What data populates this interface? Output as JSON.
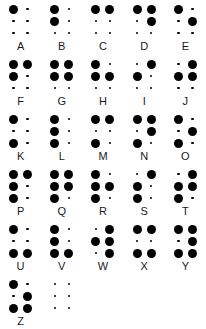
{
  "chart": {
    "background_color": "#ffffff",
    "dot_color": "#000000",
    "label_color": "#1a1a1a",
    "cells_per_row": 5,
    "dot_positions": [
      1,
      2,
      3,
      4,
      5,
      6
    ],
    "legend": {
      "raised_dot": "large filled dot",
      "flat_dot": "small filled dot"
    }
  },
  "rows": [
    {
      "index": 0,
      "cells": [
        {
          "label": "A",
          "dots": [
            1
          ]
        },
        {
          "label": "B",
          "dots": [
            1,
            2
          ]
        },
        {
          "label": "C",
          "dots": [
            1,
            4
          ]
        },
        {
          "label": "D",
          "dots": [
            1,
            4,
            5
          ]
        },
        {
          "label": "E",
          "dots": [
            1,
            5
          ]
        }
      ]
    },
    {
      "index": 1,
      "cells": [
        {
          "label": "F",
          "dots": [
            1,
            2,
            4
          ]
        },
        {
          "label": "G",
          "dots": [
            1,
            2,
            4,
            5
          ]
        },
        {
          "label": "H",
          "dots": [
            1,
            2,
            5
          ]
        },
        {
          "label": "I",
          "dots": [
            2,
            4
          ]
        },
        {
          "label": "J",
          "dots": [
            2,
            4,
            5
          ]
        }
      ]
    },
    {
      "index": 2,
      "cells": [
        {
          "label": "K",
          "dots": [
            1,
            3
          ]
        },
        {
          "label": "L",
          "dots": [
            1,
            2,
            3
          ]
        },
        {
          "label": "M",
          "dots": [
            1,
            3,
            4
          ]
        },
        {
          "label": "N",
          "dots": [
            1,
            3,
            4,
            5
          ]
        },
        {
          "label": "O",
          "dots": [
            1,
            3,
            5
          ]
        }
      ]
    },
    {
      "index": 3,
      "cells": [
        {
          "label": "P",
          "dots": [
            1,
            2,
            3,
            4
          ]
        },
        {
          "label": "Q",
          "dots": [
            1,
            2,
            3,
            4,
            5
          ]
        },
        {
          "label": "R",
          "dots": [
            1,
            2,
            3,
            5
          ]
        },
        {
          "label": "S",
          "dots": [
            2,
            3,
            4
          ]
        },
        {
          "label": "T",
          "dots": [
            2,
            3,
            4,
            5
          ]
        }
      ]
    },
    {
      "index": 4,
      "cells": [
        {
          "label": "U",
          "dots": [
            1,
            3,
            6
          ]
        },
        {
          "label": "V",
          "dots": [
            1,
            2,
            3,
            6
          ]
        },
        {
          "label": "W",
          "dots": [
            2,
            4,
            5,
            6
          ]
        },
        {
          "label": "X",
          "dots": [
            1,
            3,
            4,
            6
          ]
        },
        {
          "label": "Y",
          "dots": [
            1,
            3,
            4,
            5,
            6
          ]
        }
      ]
    },
    {
      "index": 5,
      "cells": [
        {
          "label": "Z",
          "dots": [
            1,
            3,
            5,
            6
          ]
        },
        {
          "label": "",
          "dots": []
        }
      ]
    }
  ]
}
